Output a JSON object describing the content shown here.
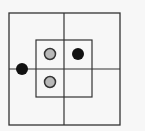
{
  "diagram": {
    "colors": {
      "background": "#f7f7f7",
      "line": "#333333",
      "black_dot": "#111111",
      "gray_dot_fill": "#b8b8b8",
      "gray_dot_stroke": "#333333"
    },
    "outer_square": {
      "x": 9,
      "y": 13,
      "w": 111,
      "h": 112
    },
    "inner_square": {
      "x": 36,
      "y": 40,
      "w": 56,
      "h": 57
    },
    "cross": {
      "vx": 64,
      "hy": 69
    },
    "dots": [
      {
        "type": "black",
        "cx": 22,
        "cy": 69
      },
      {
        "type": "gray",
        "cx": 50,
        "cy": 54
      },
      {
        "type": "black",
        "cx": 78,
        "cy": 54
      },
      {
        "type": "gray",
        "cx": 50,
        "cy": 82
      }
    ]
  }
}
